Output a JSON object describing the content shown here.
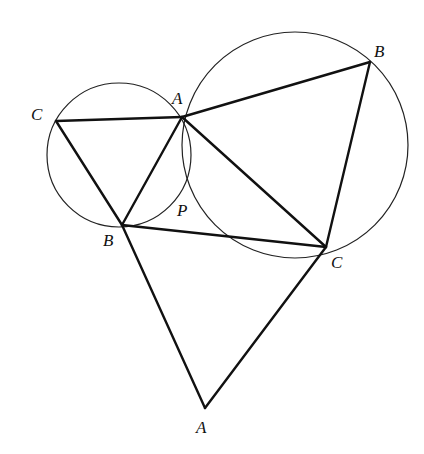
{
  "diagram": {
    "title": "",
    "points": {
      "A1": {
        "label": "A",
        "x": 182,
        "y": 117,
        "lx": 172,
        "ly": 104
      },
      "B1": {
        "label": "B",
        "x": 122,
        "y": 225,
        "lx": 103,
        "ly": 246
      },
      "C1": {
        "label": "C",
        "x": 56,
        "y": 121,
        "lx": 31,
        "ly": 120
      },
      "B2": {
        "label": "B",
        "x": 370,
        "y": 62,
        "lx": 374,
        "ly": 57
      },
      "C2": {
        "label": "C",
        "x": 326,
        "y": 247,
        "lx": 331,
        "ly": 268
      },
      "A3": {
        "label": "A",
        "x": 205,
        "y": 408,
        "lx": 196,
        "ly": 433
      },
      "P": {
        "label": "P",
        "x": 186,
        "y": 190,
        "lx": 177,
        "ly": 216
      }
    },
    "circles": [
      {
        "name": "small-circle",
        "cx": 119,
        "cy": 155,
        "r": 72
      },
      {
        "name": "large-circle",
        "cx": 295,
        "cy": 145,
        "r": 113
      }
    ],
    "segments": [
      [
        "C1",
        "A1"
      ],
      [
        "C1",
        "B1"
      ],
      [
        "A1",
        "B1"
      ],
      [
        "A1",
        "B2"
      ],
      [
        "A1",
        "C2"
      ],
      [
        "B2",
        "C2"
      ],
      [
        "B1",
        "C2"
      ],
      [
        "B1",
        "A3"
      ],
      [
        "C2",
        "A3"
      ]
    ]
  }
}
